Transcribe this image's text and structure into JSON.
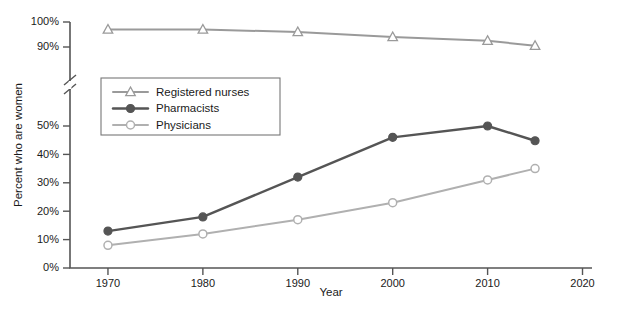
{
  "chart_data": {
    "type": "line",
    "title": "",
    "xlabel": "Year",
    "ylabel": "Percent who are women",
    "x": [
      1970,
      1980,
      1990,
      2000,
      2010,
      2015
    ],
    "xlim": [
      1966,
      2021
    ],
    "xticks": [
      "1970",
      "1980",
      "1990",
      "2000",
      "2010",
      "2020"
    ],
    "xtick_values": [
      1970,
      1980,
      1990,
      2000,
      2010,
      2020
    ],
    "yticks": [
      "0%",
      "10%",
      "20%",
      "30%",
      "40%",
      "50%",
      "90%",
      "100%"
    ],
    "ytick_values": [
      0,
      10,
      20,
      30,
      40,
      50,
      90,
      100
    ],
    "ylim": [
      0,
      100
    ],
    "axis_break": true,
    "axis_break_between": [
      50,
      90
    ],
    "grid": false,
    "legend_position": "upper-left-inside",
    "series": [
      {
        "name": "Registered nurses",
        "values": [
          97,
          97,
          96,
          94,
          92.5,
          90.5
        ],
        "color": "#9a9a9a",
        "marker": "triangle-open"
      },
      {
        "name": "Pharmacists",
        "values": [
          13,
          18,
          32,
          46,
          50,
          52.5
        ],
        "color": "#555555",
        "marker": "circle-filled"
      },
      {
        "name": "Physicians",
        "values": [
          8,
          12,
          17,
          23,
          31,
          35
        ],
        "color": "#b0b0b0",
        "marker": "circle-open"
      }
    ]
  }
}
